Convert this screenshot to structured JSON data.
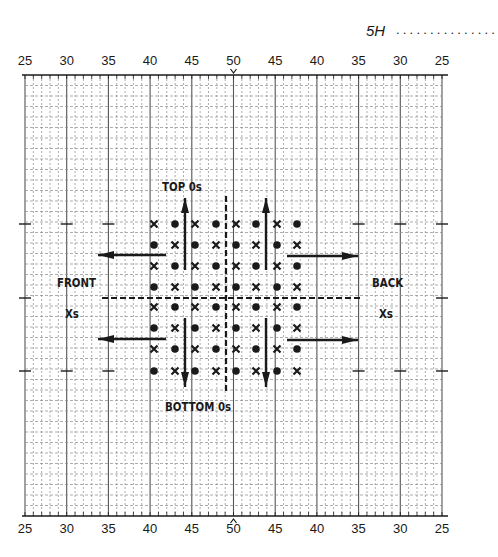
{
  "header": {
    "sheet_id": "5H",
    "leader_dots": "..............."
  },
  "axis": {
    "top_labels": [
      "25",
      "30",
      "35",
      "40",
      "45",
      "50",
      "45",
      "40",
      "35",
      "30",
      "25"
    ],
    "bottom_labels": [
      "25",
      "30",
      "35",
      "40",
      "45",
      "50",
      "45",
      "40",
      "35",
      "30",
      "25"
    ],
    "center_marker_top": "v",
    "center_marker_bottom": "^"
  },
  "grid": {
    "left": 25,
    "right": 442,
    "top": 75,
    "bottom": 516,
    "minor_vertical_units": 50,
    "major_every": 5,
    "horizontal_rows": 42,
    "side_tick_rows_y": [
      224,
      298,
      371
    ]
  },
  "labels": {
    "top": "TOP 0s",
    "bottom": "BOTTOM  0s",
    "front": "FRONT",
    "front_sub": "Xs",
    "back": "BACK",
    "back_sub": "Xs"
  },
  "markers": {
    "columns_x": [
      154,
      175,
      195,
      216,
      236,
      256,
      277,
      297
    ],
    "rows_y": [
      224,
      245,
      266,
      287,
      307,
      328,
      349,
      371
    ],
    "pattern_first_row": [
      "x",
      "dot",
      "x",
      "dot",
      "x",
      "dot",
      "x",
      "dot"
    ],
    "pattern": "checkerboard"
  },
  "arrows": [
    {
      "dir": "up",
      "x": 185,
      "y1": 270,
      "y2": 198
    },
    {
      "dir": "up",
      "x": 266,
      "y1": 270,
      "y2": 198
    },
    {
      "dir": "down",
      "x": 185,
      "y1": 318,
      "y2": 387
    },
    {
      "dir": "down",
      "x": 266,
      "y1": 318,
      "y2": 387
    },
    {
      "dir": "left",
      "y": 255,
      "x1": 166,
      "x2": 98
    },
    {
      "dir": "left",
      "y": 339,
      "x1": 166,
      "x2": 98
    },
    {
      "dir": "right",
      "y": 256,
      "x1": 287,
      "x2": 358
    },
    {
      "dir": "right",
      "y": 340,
      "x1": 287,
      "x2": 358
    }
  ],
  "dashed_lines": {
    "horizontal": {
      "y": 298,
      "x1": 102,
      "x2": 360
    },
    "vertical": {
      "x": 226,
      "y1": 196,
      "y2": 392
    }
  },
  "colors": {
    "ink": "#1a1a1a",
    "grid_major": "#555555",
    "grid_minor": "#8a8a8a",
    "paper": "#ffffff"
  }
}
